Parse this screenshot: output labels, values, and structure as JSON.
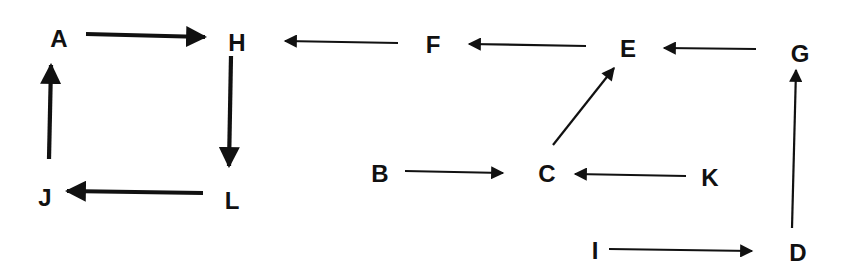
{
  "diagram": {
    "type": "directed-graph",
    "nodes": [
      {
        "id": "A",
        "label": "A",
        "x": 59,
        "y": 38
      },
      {
        "id": "H",
        "label": "H",
        "x": 237,
        "y": 42
      },
      {
        "id": "F",
        "label": "F",
        "x": 433,
        "y": 44
      },
      {
        "id": "E",
        "label": "E",
        "x": 628,
        "y": 48
      },
      {
        "id": "G",
        "label": "G",
        "x": 800,
        "y": 53
      },
      {
        "id": "J",
        "label": "J",
        "x": 45,
        "y": 197
      },
      {
        "id": "L",
        "label": "L",
        "x": 232,
        "y": 200
      },
      {
        "id": "B",
        "label": "B",
        "x": 380,
        "y": 173
      },
      {
        "id": "C",
        "label": "C",
        "x": 547,
        "y": 173
      },
      {
        "id": "K",
        "label": "K",
        "x": 710,
        "y": 177
      },
      {
        "id": "I",
        "label": "I",
        "x": 595,
        "y": 250
      },
      {
        "id": "D",
        "label": "D",
        "x": 798,
        "y": 252
      }
    ],
    "edges": [
      {
        "from": "A",
        "to": "H",
        "style": "bold",
        "x1": 86,
        "y1": 34,
        "x2": 205,
        "y2": 37
      },
      {
        "from": "H",
        "to": "L",
        "style": "bold",
        "x1": 231,
        "y1": 56,
        "x2": 229,
        "y2": 166
      },
      {
        "from": "L",
        "to": "J",
        "style": "bold",
        "x1": 203,
        "y1": 193,
        "x2": 67,
        "y2": 191
      },
      {
        "from": "J",
        "to": "A",
        "style": "bold",
        "x1": 49,
        "y1": 159,
        "x2": 51,
        "y2": 65
      },
      {
        "from": "F",
        "to": "H",
        "style": "thin",
        "x1": 398,
        "y1": 43,
        "x2": 285,
        "y2": 41
      },
      {
        "from": "E",
        "to": "F",
        "style": "thin",
        "x1": 586,
        "y1": 46,
        "x2": 469,
        "y2": 44
      },
      {
        "from": "G",
        "to": "E",
        "style": "thin",
        "x1": 756,
        "y1": 49,
        "x2": 664,
        "y2": 48
      },
      {
        "from": "C",
        "to": "E",
        "style": "thin",
        "x1": 553,
        "y1": 145,
        "x2": 614,
        "y2": 68
      },
      {
        "from": "B",
        "to": "C",
        "style": "thin",
        "x1": 405,
        "y1": 171,
        "x2": 503,
        "y2": 173
      },
      {
        "from": "K",
        "to": "C",
        "style": "thin",
        "x1": 686,
        "y1": 176,
        "x2": 575,
        "y2": 174
      },
      {
        "from": "I",
        "to": "D",
        "style": "thin",
        "x1": 609,
        "y1": 249,
        "x2": 752,
        "y2": 251
      },
      {
        "from": "D",
        "to": "G",
        "style": "thin",
        "x1": 792,
        "y1": 228,
        "x2": 796,
        "y2": 70
      }
    ],
    "colors": {
      "stroke": "#111111",
      "background": "#ffffff"
    }
  }
}
